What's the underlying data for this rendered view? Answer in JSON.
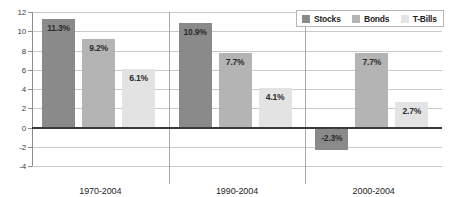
{
  "chart_data": {
    "type": "bar",
    "title": "",
    "subtitle": "",
    "xlabel": "",
    "ylabel": "",
    "categories": [
      "1970-2004",
      "1990-2004",
      "2000-2004"
    ],
    "series": [
      {
        "name": "Stocks",
        "color": "#8a8a8a",
        "values": [
          11.3,
          10.9,
          -2.3
        ],
        "labels": [
          "11.3%",
          "10.9%",
          "-2.3%"
        ]
      },
      {
        "name": "Bonds",
        "color": "#b4b4b4",
        "values": [
          9.2,
          7.7,
          7.7
        ],
        "labels": [
          "9.2%",
          "7.7%",
          "7.7%"
        ]
      },
      {
        "name": "T-Bills",
        "color": "#e3e3e3",
        "values": [
          6.1,
          4.1,
          2.7
        ],
        "labels": [
          "6.1%",
          "4.1%",
          "2.7%"
        ]
      }
    ],
    "ylim": [
      -4,
      12
    ],
    "yticks": [
      12,
      10,
      8,
      6,
      4,
      2,
      0,
      -2,
      -4
    ],
    "ytick_labels": [
      "12",
      "10",
      "8",
      "6",
      "4",
      "2",
      "0",
      "-2",
      "-4"
    ],
    "grid": true,
    "legend_position": "top-right"
  },
  "legend": {
    "items": [
      {
        "label": "Stocks",
        "color": "#8a8a8a"
      },
      {
        "label": "Bonds",
        "color": "#b4b4b4"
      },
      {
        "label": "T-Bills",
        "color": "#e3e3e3"
      }
    ]
  }
}
